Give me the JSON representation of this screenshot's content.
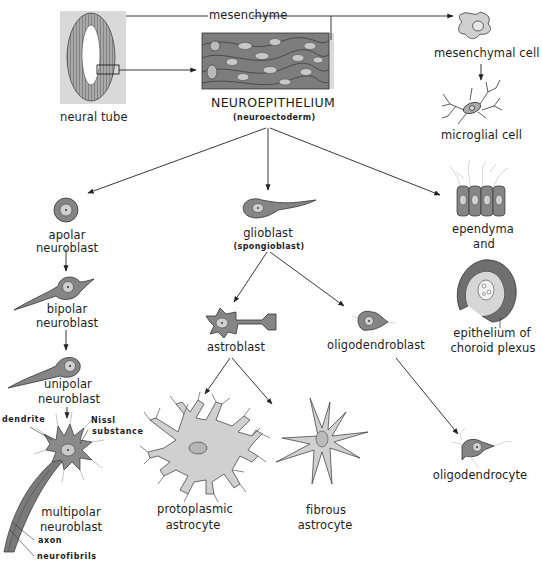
{
  "diagram": {
    "title": "NEUROEPITHELIUM",
    "subtitle": "(neuroectoderm)",
    "colors": {
      "cell_dark": "#7f7f7f",
      "cell_mid": "#9a9a9a",
      "cell_light": "#c9c9c9",
      "nucleus": "#d6d6d6",
      "background_panel": "#d9d9d9",
      "line": "#222222"
    },
    "nodes": {
      "neural_tube": {
        "label": "neural tube"
      },
      "mesenchyme": {
        "label": "mesenchyme"
      },
      "neuroepithelium": {
        "label": "NEUROEPITHELIUM",
        "sublabel": "(neuroectoderm)"
      },
      "mesenchymal_cell": {
        "label": "mesenchymal cell"
      },
      "microglial_cell": {
        "label": "microglial cell"
      },
      "apolar_neuroblast": {
        "line1": "apolar",
        "line2": "neuroblast"
      },
      "bipolar_neuroblast": {
        "line1": "bipolar",
        "line2": "neuroblast"
      },
      "unipolar_neuroblast": {
        "line1": "unipolar",
        "line2": "neuroblast"
      },
      "multipolar_neuroblast": {
        "line1": "multipolar",
        "line2": "neuroblast"
      },
      "glioblast": {
        "label": "glioblast",
        "sublabel": "(spongioblast)"
      },
      "astroblast": {
        "label": "astroblast"
      },
      "oligodendroblast": {
        "label": "oligodendroblast"
      },
      "protoplasmic_astrocyte": {
        "line1": "protoplasmic",
        "line2": "astrocyte"
      },
      "fibrous_astrocyte": {
        "line1": "fibrous",
        "line2": "astrocyte"
      },
      "oligodendrocyte": {
        "label": "oligodendrocyte"
      },
      "ependyma": {
        "line1": "ependyma",
        "line2": "and"
      },
      "choroid_plexus": {
        "line1": "epithelium of",
        "line2": "choroid plexus"
      }
    },
    "annotations": {
      "dendrite": "dendrite",
      "nissl": "Nissl",
      "nissl2": "substance",
      "axon": "axon",
      "neurofibrils": "neurofibrils"
    },
    "edges": [
      {
        "from": "neural tube",
        "to": "NEUROEPITHELIUM"
      },
      {
        "from": "neural tube",
        "to": "mesenchymal cell",
        "label": "mesenchyme"
      },
      {
        "from": "mesenchymal cell",
        "to": "microglial cell"
      },
      {
        "from": "NEUROEPITHELIUM",
        "to": "apolar neuroblast"
      },
      {
        "from": "NEUROEPITHELIUM",
        "to": "glioblast"
      },
      {
        "from": "NEUROEPITHELIUM",
        "to": "ependyma and epithelium of choroid plexus"
      },
      {
        "from": "apolar neuroblast",
        "to": "bipolar neuroblast"
      },
      {
        "from": "bipolar neuroblast",
        "to": "unipolar neuroblast"
      },
      {
        "from": "unipolar neuroblast",
        "to": "multipolar neuroblast"
      },
      {
        "from": "glioblast",
        "to": "astroblast"
      },
      {
        "from": "glioblast",
        "to": "oligodendroblast"
      },
      {
        "from": "astroblast",
        "to": "protoplasmic astrocyte"
      },
      {
        "from": "astroblast",
        "to": "fibrous astrocyte"
      },
      {
        "from": "oligodendroblast",
        "to": "oligodendrocyte"
      }
    ]
  }
}
